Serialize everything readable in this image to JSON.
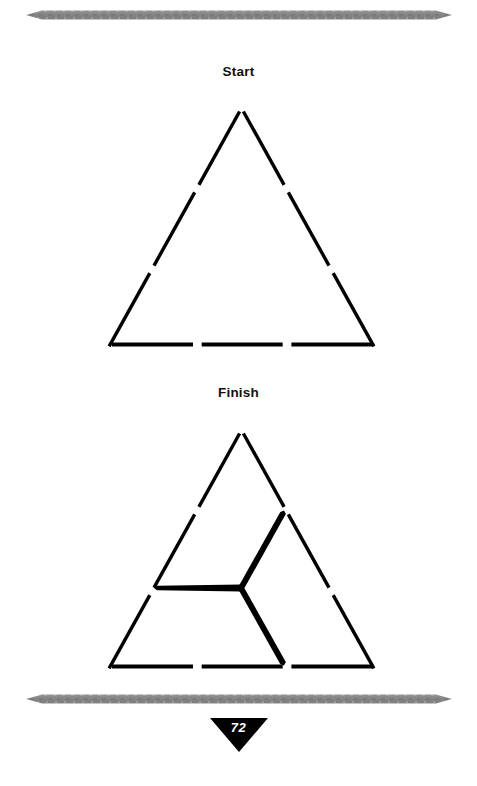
{
  "page": {
    "number": "72",
    "background_color": "#ffffff",
    "ink_color": "#000000",
    "rule_color": "#8c8c8c"
  },
  "decorations": {
    "top_rule_name": "tapered-gray-rule",
    "bottom_rule_name": "tapered-gray-rule"
  },
  "puzzle": {
    "type": "matchstick-puzzle",
    "stick_color": "#000000",
    "sections": [
      {
        "id": "start",
        "label": "Start",
        "description": "Equilateral triangle outlined by nine matchsticks, three on each side.",
        "outline_sticks": 9,
        "interior_sticks": 0
      },
      {
        "id": "finish",
        "label": "Finish",
        "description": "Same nine-stick triangle with three extra matchsticks meeting at a central point to form a three-spoke figure.",
        "outline_sticks": 9,
        "interior_sticks": 3
      }
    ]
  },
  "geometry": {
    "triangle": {
      "apex_x": 241.5,
      "left_x": 113,
      "right_x": 370,
      "base_y": 231,
      "apex_y": 10,
      "side_segments": 3,
      "gap": 7
    },
    "spokes": {
      "center_x": 241.5,
      "center_y": 166,
      "endpoints": [
        {
          "name": "spoke-left",
          "x": 155,
          "y": 166
        },
        {
          "name": "spoke-upper-right",
          "x": 284,
          "y": 91
        },
        {
          "name": "spoke-lower-right",
          "x": 284,
          "y": 241
        }
      ],
      "thickness": 7
    }
  }
}
